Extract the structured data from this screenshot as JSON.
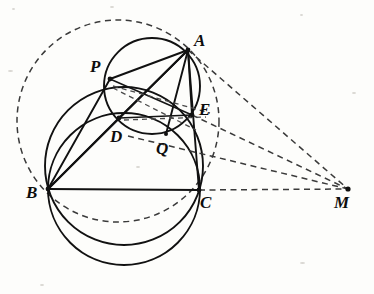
{
  "figure": {
    "width": 374,
    "height": 294,
    "background_color": "#fdfdfb",
    "stroke_color": "#111111",
    "dash_color": "#3a3a3a"
  },
  "labels": {
    "A": "A",
    "B": "B",
    "C": "C",
    "D": "D",
    "E": "E",
    "M": "M",
    "P": "P",
    "Q": "Q"
  },
  "points": {
    "A": {
      "name": "A",
      "x": 188,
      "y": 50
    },
    "B": {
      "name": "B",
      "x": 48,
      "y": 189
    },
    "C": {
      "name": "C",
      "x": 199,
      "y": 190
    },
    "D": {
      "name": "D",
      "x": 119,
      "y": 118
    },
    "E": {
      "name": "E",
      "x": 192,
      "y": 115
    },
    "M": {
      "name": "M",
      "x": 348,
      "y": 189
    },
    "P": {
      "name": "P",
      "x": 110,
      "y": 79
    },
    "Q": {
      "name": "Q",
      "x": 166,
      "y": 134
    }
  },
  "label_positions": {
    "A": {
      "x": 194,
      "y": 32
    },
    "B": {
      "x": 26,
      "y": 184
    },
    "C": {
      "x": 200,
      "y": 194
    },
    "D": {
      "x": 110,
      "y": 128
    },
    "E": {
      "x": 199,
      "y": 101
    },
    "M": {
      "x": 334,
      "y": 194
    },
    "P": {
      "x": 90,
      "y": 58
    },
    "Q": {
      "x": 156,
      "y": 140
    }
  },
  "circles": [
    {
      "name": "circumcircle-ABC",
      "style": "dashed",
      "cx": 118,
      "cy": 121,
      "r": 101
    },
    {
      "name": "circle-BPC",
      "style": "solid",
      "cx": 124,
      "cy": 189,
      "r": 76
    },
    {
      "name": "circle-BDEC",
      "style": "solid",
      "cx": 124,
      "cy": 166,
      "r": 79
    },
    {
      "name": "circle-APDQE",
      "style": "solid",
      "cx": 152,
      "cy": 86,
      "r": 48
    }
  ],
  "solid_segments": [
    {
      "name": "segment-BC",
      "from": "B",
      "to": "C"
    },
    {
      "name": "segment-AB",
      "from": "A",
      "to": "B"
    },
    {
      "name": "segment-AC",
      "from": "A",
      "to": "C"
    },
    {
      "name": "segment-AD",
      "from": "A",
      "to": "D"
    },
    {
      "name": "segment-AP",
      "from": "A",
      "to": "P"
    },
    {
      "name": "segment-AQ",
      "from": "A",
      "to": "Q"
    },
    {
      "name": "segment-AE",
      "from": "A",
      "to": "E"
    },
    {
      "name": "segment-BD",
      "from": "B",
      "to": "D"
    },
    {
      "name": "segment-BP",
      "from": "B",
      "to": "P"
    },
    {
      "name": "segment-DE",
      "from": "D",
      "to": "E"
    },
    {
      "name": "segment-PE",
      "from": "P",
      "to": "E"
    }
  ],
  "dashed_segments": [
    {
      "name": "dashed-A-to-M",
      "from": "A",
      "to": "M"
    },
    {
      "name": "dashed-E-to-M",
      "from": "E",
      "to": "M"
    },
    {
      "name": "dashed-Q-to-M",
      "from": "Q",
      "to": "M"
    },
    {
      "name": "dashed-C-to-M",
      "from": "C",
      "to": "M"
    },
    {
      "name": "dashed-P-to-E",
      "from": "P",
      "to": "E"
    },
    {
      "name": "dashed-P-to-Q",
      "from": "P",
      "to": "Q"
    },
    {
      "name": "dashed-D-to-E",
      "from": "D",
      "to": "E"
    }
  ],
  "vertex_dots": [
    "A",
    "B",
    "C",
    "D",
    "E",
    "M",
    "P",
    "Q"
  ]
}
